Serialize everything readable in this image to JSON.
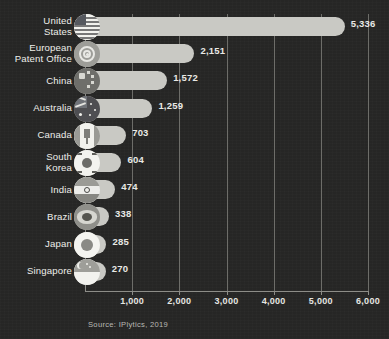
{
  "chart_data": {
    "type": "bar",
    "orientation": "horizontal",
    "title": "",
    "xlabel": "",
    "ylabel": "",
    "xlim": [
      0,
      6000
    ],
    "grid": true,
    "legend": "none",
    "tick_labels": [
      "1,000",
      "2,000",
      "3,000",
      "4,000",
      "5,000",
      "6,000"
    ],
    "ticks": [
      1000,
      2000,
      3000,
      4000,
      5000,
      6000
    ],
    "categories": [
      "United\nStates",
      "European\nPatent Office",
      "China",
      "Australia",
      "Canada",
      "South\nKorea",
      "India",
      "Brazil",
      "Japan",
      "Singapore"
    ],
    "values": [
      5336,
      2151,
      1572,
      1259,
      703,
      604,
      474,
      338,
      285,
      270
    ],
    "value_labels": [
      "5,336",
      "2,151",
      "1,572",
      "1,259",
      "703",
      "604",
      "474",
      "338",
      "285",
      "270"
    ],
    "flags": [
      "flag-united-states",
      "flag-european-patent-office",
      "flag-china",
      "flag-australia",
      "flag-canada",
      "flag-south-korea",
      "flag-india",
      "flag-brazil",
      "flag-japan",
      "flag-singapore"
    ],
    "bar_color": "#c9c9c4",
    "background_color": "#262625",
    "grid_color": "#6d6d69",
    "text_color": "#eeeeea"
  },
  "source": {
    "text": "Source: IPlytics, 2019"
  }
}
